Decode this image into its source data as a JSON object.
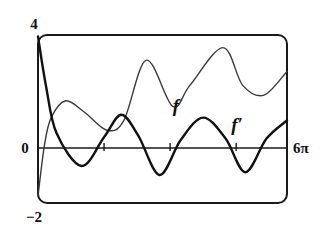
{
  "chart_data": {
    "type": "line",
    "title": "",
    "xlabel": "",
    "ylabel": "",
    "xlim": [
      0,
      18.85
    ],
    "ylim": [
      -2,
      4
    ],
    "x_tick_labels": {
      "left": "",
      "right": "6π"
    },
    "y_tick_labels": {
      "top": "4",
      "zero": "0",
      "bottom": "−2"
    },
    "x_ticks": [
      5,
      10,
      15
    ],
    "grid": false,
    "legend": "inline labels",
    "series": [
      {
        "name": "f",
        "label": "f",
        "style": "thin gray",
        "points": [
          [
            0.0,
            -1.75
          ],
          [
            0.5,
            0.1
          ],
          [
            1.0,
            1.05
          ],
          [
            2.1,
            1.65
          ],
          [
            3.5,
            1.25
          ],
          [
            5.2,
            0.6
          ],
          [
            6.5,
            0.95
          ],
          [
            8.2,
            3.1
          ],
          [
            10.2,
            1.45
          ],
          [
            11.5,
            2.2
          ],
          [
            14.0,
            3.55
          ],
          [
            15.5,
            2.2
          ],
          [
            17.1,
            1.85
          ],
          [
            18.85,
            2.7
          ]
        ]
      },
      {
        "name": "f'",
        "label": "f′",
        "style": "thick black",
        "points": [
          [
            0.0,
            3.95
          ],
          [
            0.6,
            2.2
          ],
          [
            1.4,
            0.5
          ],
          [
            3.3,
            -0.68
          ],
          [
            5.0,
            0.35
          ],
          [
            6.3,
            1.15
          ],
          [
            7.6,
            0.4
          ],
          [
            9.2,
            -1.0
          ],
          [
            10.8,
            0.25
          ],
          [
            12.5,
            1.05
          ],
          [
            14.2,
            0.3
          ],
          [
            15.7,
            -0.9
          ],
          [
            17.3,
            0.3
          ],
          [
            18.85,
            0.95
          ]
        ]
      }
    ]
  },
  "labels": {
    "y_top": "4",
    "y_zero": "0",
    "y_bottom": "−2",
    "x_right": "6π",
    "curve_f": "f",
    "curve_fprime": "f′"
  }
}
